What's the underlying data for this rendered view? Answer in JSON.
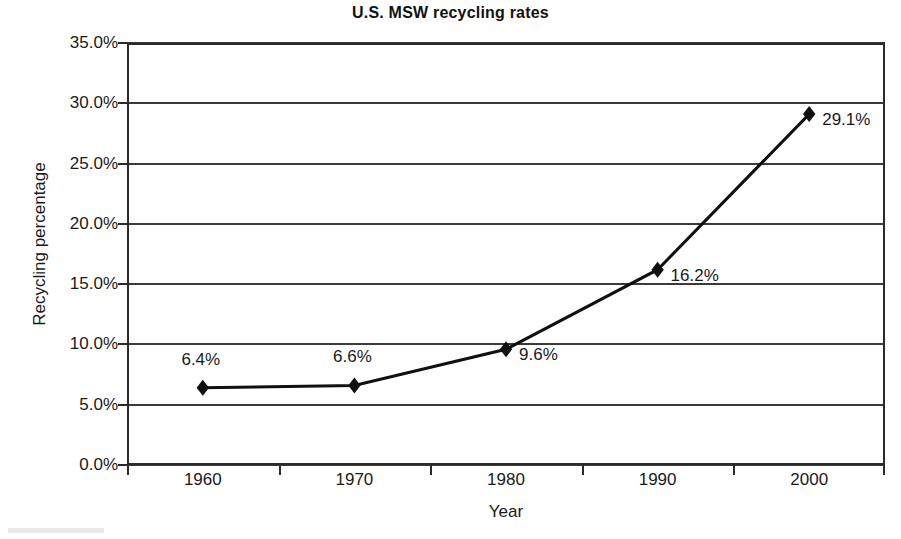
{
  "chart_data": {
    "type": "line",
    "title": "U.S. MSW recycling rates",
    "xlabel": "Year",
    "ylabel": "Recycling percentage",
    "categories": [
      "1960",
      "1970",
      "1980",
      "1990",
      "2000"
    ],
    "values": [
      6.4,
      6.6,
      9.6,
      16.2,
      29.1
    ],
    "point_labels": [
      "6.4%",
      "6.6%",
      "9.6%",
      "16.2%",
      "29.1%"
    ],
    "ylim": [
      0,
      35
    ],
    "ytick_values": [
      0,
      5,
      10,
      15,
      20,
      25,
      30,
      35
    ],
    "ytick_labels": [
      "0.0%",
      "5.0%",
      "10.0%",
      "15.0%",
      "20.0%",
      "25.0%",
      "30.0%",
      "35.0%"
    ],
    "grid": true,
    "legend": false,
    "series_color": "#101010",
    "marker": "diamond",
    "label_positions": [
      "above",
      "above",
      "right",
      "right",
      "right"
    ]
  }
}
